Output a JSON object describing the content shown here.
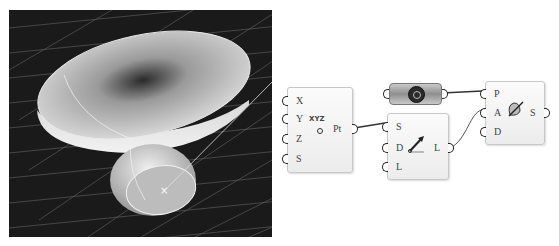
{
  "viewport": {
    "name": "rhino-3d-viewport",
    "background": "#1a1a1a",
    "grid_color": "#5a5a5a",
    "object": "bowl-shaped surface with sphere base",
    "cursor_marker": "×"
  },
  "graph": {
    "nodes": [
      {
        "id": "construct-point",
        "inputs": [
          "X",
          "Y",
          "Z",
          "S"
        ],
        "outputs": [
          "Pt"
        ],
        "icon": "xyz-point-icon",
        "icon_text": "XYZ"
      },
      {
        "id": "param-geometry",
        "inputs": [
          ""
        ],
        "outputs": [
          ""
        ],
        "icon": "hexagon-nut-icon"
      },
      {
        "id": "line-sdl",
        "inputs": [
          "S",
          "D",
          "L"
        ],
        "outputs": [
          "L"
        ],
        "icon": "line-arrow-icon"
      },
      {
        "id": "revolve-sweep",
        "inputs": [
          "P",
          "A",
          "D"
        ],
        "outputs": [
          "S"
        ],
        "icon": "revolution-surface-icon"
      }
    ],
    "wire_color": "#333333"
  }
}
